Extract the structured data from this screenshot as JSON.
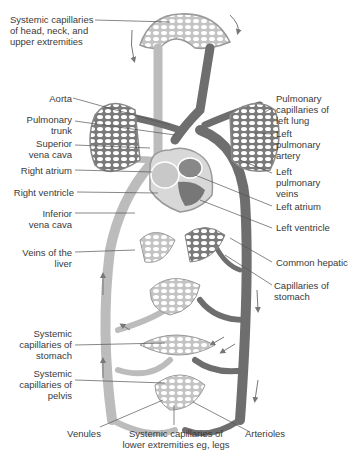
{
  "diagram": {
    "type": "circulatory-system",
    "colors": {
      "vein_light": "#b8b8b8",
      "artery_dark": "#6a6a6a",
      "capillary_fill": "#c9c9c9",
      "capillary_holes": "#ffffff",
      "leader_line": "#555555",
      "text": "#3a3a3a"
    },
    "labels": {
      "sys_cap_head": "Systemic capillaries\nof head, neck, and\nupper extremities",
      "aorta": "Aorta",
      "pulm_trunk": "Pulmonary\ntrunk",
      "sup_vena_cava": "Superior\nvena cava",
      "right_atrium": "Right atrium",
      "right_ventricle": "Right ventricle",
      "inf_vena_cava": "Inferior\nvena cava",
      "veins_liver": "Veins of the\nliver",
      "pulm_cap_left_lung": "Pulmonary\ncapillaries of\nleft lung",
      "left_pulm_artery": "Left\npulmonary\nartery",
      "left_pulm_veins": "Left\npulmonary\nveins",
      "left_atrium": "Left atrium",
      "left_ventricle": "Left ventricle",
      "common_hepatic": "Common hepatic",
      "cap_stomach_right": "Capillaries of\nstomach",
      "sys_cap_stomach": "Systemic\ncapillaries of\nstomach",
      "sys_cap_pelvis": "Systemic\ncapillaries of\npelvis",
      "venules": "Venules",
      "sys_cap_lower": "Systemic capillaries of\nlower extremities eg, legs",
      "arterioles": "Arterioles"
    }
  }
}
